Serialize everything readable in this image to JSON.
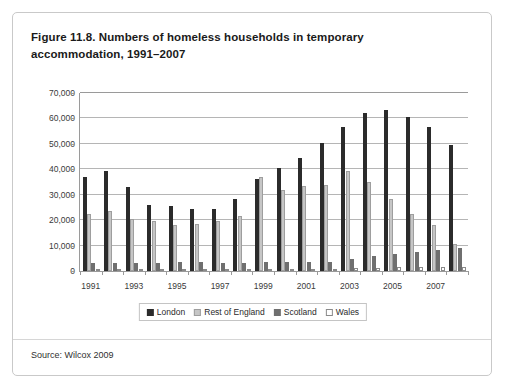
{
  "figure": {
    "title": "Figure 11.8. Numbers of homeless households in temporary accommodation, 1991–2007",
    "source": "Source: Wilcox 2009"
  },
  "chart_data": {
    "type": "bar",
    "title": "Figure 11.8. Numbers of homeless households in temporary accommodation, 1991–2007",
    "xlabel": "",
    "ylabel": "",
    "ylim": [
      0,
      70000
    ],
    "ytick_values": [
      0,
      10000,
      20000,
      30000,
      40000,
      50000,
      60000,
      70000
    ],
    "ytick_labels": [
      "0",
      "10,000",
      "20,000",
      "30,000",
      "40,000",
      "50,000",
      "60,000",
      "70,000"
    ],
    "grid": true,
    "legend_position": "bottom",
    "categories": [
      "1991",
      "1992",
      "1993",
      "1994",
      "1995",
      "1996",
      "1997",
      "1998",
      "1999",
      "2000",
      "2001",
      "2002",
      "2003",
      "2004",
      "2005",
      "2006",
      "2007",
      "2008"
    ],
    "xtick_labels_shown": [
      "1991",
      "1993",
      "1995",
      "1997",
      "1999",
      "2001",
      "2003",
      "2005",
      "2007"
    ],
    "series": [
      {
        "name": "London",
        "color": "#2b2b2b",
        "values": [
          37000,
          39500,
          33000,
          26000,
          25500,
          24500,
          24500,
          28500,
          36000,
          40500,
          44500,
          50500,
          56500,
          62000,
          63500,
          60500,
          56500,
          49500
        ]
      },
      {
        "name": "Rest of England",
        "color": "#c6c6c6",
        "values": [
          22500,
          23500,
          20500,
          19500,
          18000,
          18500,
          19800,
          21500,
          37000,
          32000,
          33500,
          34000,
          39500,
          35000,
          28500,
          22500,
          18000,
          10500
        ]
      },
      {
        "name": "Scotland",
        "color": "#6f6f6f",
        "values": [
          3200,
          3300,
          3100,
          3300,
          3400,
          3400,
          3300,
          3300,
          3400,
          3500,
          3500,
          3600,
          4700,
          5800,
          6800,
          7300,
          8200,
          9000
        ]
      },
      {
        "name": "Wales",
        "color": "#ffffff",
        "values": [
          900,
          800,
          900,
          800,
          700,
          700,
          700,
          800,
          800,
          800,
          800,
          900,
          1000,
          1300,
          1400,
          1500,
          1600,
          1700
        ]
      }
    ]
  }
}
